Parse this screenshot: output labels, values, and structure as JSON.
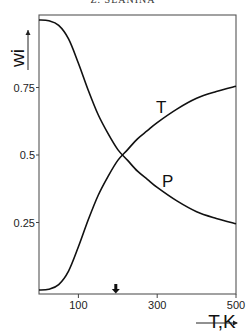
{
  "header": {
    "text": "Z. SLANINA"
  },
  "chart_data": {
    "type": "line",
    "title": "",
    "xlabel": "T,K",
    "ylabel": "wi",
    "xlim": [
      0,
      500
    ],
    "ylim": [
      0,
      1
    ],
    "x_ticks": [
      100,
      300,
      500
    ],
    "x_tick_labels": [
      "100",
      "300",
      "500"
    ],
    "y_ticks": [
      0.25,
      0.5,
      0.75
    ],
    "y_tick_labels": [
      "0.25",
      "0.5",
      "0.75"
    ],
    "grid": false,
    "legend": "inline curve labels",
    "annotations": [
      {
        "type": "arrow-down",
        "x": 200,
        "note": "marker on x-axis"
      }
    ],
    "x": [
      0,
      25,
      50,
      75,
      100,
      125,
      150,
      175,
      200,
      225,
      250,
      275,
      300,
      350,
      400,
      450,
      500
    ],
    "series": [
      {
        "name": "T",
        "values": [
          0.0,
          0.003,
          0.02,
          0.07,
          0.16,
          0.26,
          0.35,
          0.42,
          0.48,
          0.52,
          0.56,
          0.59,
          0.62,
          0.67,
          0.71,
          0.735,
          0.755
        ]
      },
      {
        "name": "P",
        "values": [
          1.0,
          0.997,
          0.98,
          0.93,
          0.84,
          0.74,
          0.65,
          0.58,
          0.52,
          0.48,
          0.44,
          0.41,
          0.38,
          0.33,
          0.29,
          0.265,
          0.245
        ]
      }
    ]
  }
}
